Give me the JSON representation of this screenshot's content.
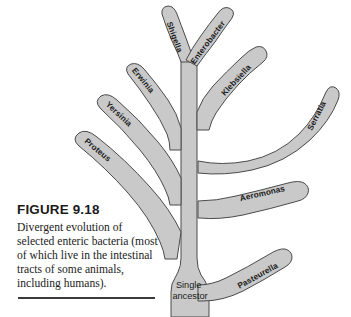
{
  "figure": {
    "number_label": "FIGURE 9.18",
    "caption": "Divergent evolution of selected enteric bacteria (most of which live in the intestinal tracts of some animals, including humans).",
    "rule_color": "#3a3a3a"
  },
  "diagram": {
    "type": "phylogenetic-tree",
    "root_label": "Single ancestor",
    "fill_color": "#c9c9c9",
    "outline_color": "#4a4a4a",
    "background_color": "#ffffff",
    "branches": [
      {
        "name": "Proteus",
        "label": "Proteus",
        "side": "left",
        "order": 1
      },
      {
        "name": "Yersinia",
        "label": "Yersinia",
        "side": "left",
        "order": 2
      },
      {
        "name": "Erwinia",
        "label": "Erwinia",
        "side": "left",
        "order": 3
      },
      {
        "name": "Shigella",
        "label": "Shigella",
        "side": "top-left",
        "order": 4
      },
      {
        "name": "Enterobacter",
        "label": "Enterobacter",
        "side": "top-right",
        "order": 5
      },
      {
        "name": "Klebsiella",
        "label": "Klebsiella",
        "side": "right",
        "order": 6
      },
      {
        "name": "Serratia",
        "label": "Serratia",
        "side": "right",
        "order": 7
      },
      {
        "name": "Aeromonas",
        "label": "Aeromonas",
        "side": "right",
        "order": 8
      },
      {
        "name": "Pasteurella",
        "label": "Pasteurella",
        "side": "right",
        "order": 9
      }
    ]
  }
}
